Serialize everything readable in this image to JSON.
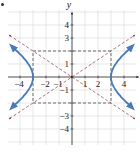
{
  "chart_data": {
    "type": "line",
    "title": "",
    "xlabel": "",
    "ylabel": "y",
    "xlim": [
      -4.8,
      4.8
    ],
    "ylim": [
      -5,
      5
    ],
    "grid": true,
    "x_ticks": [
      -4,
      -2,
      -1,
      1,
      2,
      4
    ],
    "x_tick_labels": [
      "−4",
      "−2",
      "−1",
      "1",
      "2",
      "4"
    ],
    "y_ticks": [
      4,
      3,
      1,
      -1,
      -3,
      -4
    ],
    "y_tick_labels": [
      "4",
      "3",
      "1",
      "−1",
      "−3",
      "−4"
    ],
    "equation": "x^2/9 - y^2/4 = 1",
    "series": [
      {
        "name": "hyperbola right branch",
        "style": "solid",
        "color": "#4a7ab5",
        "arrows": true,
        "points": [
          [
            4.6,
            2.32
          ],
          [
            4.0,
            1.76
          ],
          [
            3.5,
            1.2
          ],
          [
            3.2,
            0.74
          ],
          [
            3.0,
            0
          ],
          [
            3.2,
            -0.74
          ],
          [
            3.5,
            -1.2
          ],
          [
            4.0,
            -1.76
          ],
          [
            4.6,
            -2.32
          ]
        ]
      },
      {
        "name": "hyperbola left branch",
        "style": "solid",
        "color": "#4a7ab5",
        "arrows": true,
        "points": [
          [
            -4.6,
            2.32
          ],
          [
            -4.0,
            1.76
          ],
          [
            -3.5,
            1.2
          ],
          [
            -3.2,
            0.74
          ],
          [
            -3.0,
            0
          ],
          [
            -3.2,
            -0.74
          ],
          [
            -3.5,
            -1.2
          ],
          [
            -4.0,
            -1.76
          ],
          [
            -4.6,
            -2.32
          ]
        ]
      },
      {
        "name": "asymptote y = 2x/3",
        "style": "dashed",
        "color": "#8a3a4a",
        "arrows": true,
        "points": [
          [
            -4.8,
            -3.2
          ],
          [
            4.8,
            3.2
          ]
        ]
      },
      {
        "name": "asymptote y = -2x/3",
        "style": "dashed",
        "color": "#8a3a4a",
        "arrows": true,
        "points": [
          [
            -4.8,
            3.2
          ],
          [
            4.8,
            -3.2
          ]
        ]
      },
      {
        "name": "central rectangle",
        "style": "dashed",
        "color": "#333333",
        "points": [
          [
            -3,
            2
          ],
          [
            3,
            2
          ],
          [
            3,
            -2
          ],
          [
            -3,
            -2
          ],
          [
            -3,
            2
          ]
        ]
      }
    ],
    "vertices": [
      [
        -3,
        0
      ],
      [
        3,
        0
      ]
    ]
  },
  "colors": {
    "curve": "#4a7ab5",
    "asymptote": "#8a3a4a",
    "grid": "#d6d6d6",
    "axis": "#333333"
  }
}
